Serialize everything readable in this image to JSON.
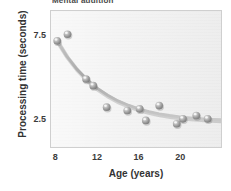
{
  "chart_data": {
    "type": "scatter",
    "title": "Mental addition",
    "xlabel": "Age (years)",
    "ylabel": "Processing time (seconds)",
    "xlim": [
      7.5,
      24.0
    ],
    "ylim": [
      0.8,
      9.0
    ],
    "xticks": [
      8,
      12,
      16,
      20
    ],
    "xticklabels": [
      "8",
      "12",
      "16",
      "20"
    ],
    "yticks": [
      2.5,
      7.5
    ],
    "yticklabels": [
      "2.5",
      "7.5"
    ],
    "grid": false,
    "legend": false,
    "x": [
      8.1,
      9.1,
      10.9,
      11.6,
      12.9,
      14.9,
      16.1,
      16.7,
      18.0,
      19.7,
      20.3,
      21.6,
      22.7
    ],
    "y": [
      7.2,
      7.6,
      4.9,
      4.5,
      3.2,
      3.0,
      3.1,
      2.4,
      3.3,
      2.2,
      2.5,
      2.7,
      2.5
    ],
    "points": [
      {
        "age": 8.1,
        "seconds": 7.2
      },
      {
        "age": 9.1,
        "seconds": 7.6
      },
      {
        "age": 10.9,
        "seconds": 4.9
      },
      {
        "age": 11.6,
        "seconds": 4.5
      },
      {
        "age": 12.9,
        "seconds": 3.2
      },
      {
        "age": 14.9,
        "seconds": 3.0
      },
      {
        "age": 16.1,
        "seconds": 3.1
      },
      {
        "age": 16.7,
        "seconds": 2.4
      },
      {
        "age": 18.0,
        "seconds": 3.3
      },
      {
        "age": 19.7,
        "seconds": 2.2
      },
      {
        "age": 20.3,
        "seconds": 2.5
      },
      {
        "age": 21.6,
        "seconds": 2.7
      },
      {
        "age": 22.7,
        "seconds": 2.5
      }
    ],
    "fit_curve": {
      "name": "exponential decay fit",
      "asymptote": 2.35,
      "x": [
        8.0,
        9.0,
        10.0,
        11.0,
        12.0,
        13.0,
        14.0,
        15.0,
        16.0,
        17.0,
        18.0,
        19.0,
        20.0,
        21.0,
        22.0,
        23.0,
        24.0
      ],
      "y": [
        7.3,
        6.3,
        5.5,
        4.85,
        4.33,
        3.92,
        3.58,
        3.32,
        3.1,
        2.93,
        2.8,
        2.7,
        2.62,
        2.56,
        2.51,
        2.47,
        2.44
      ]
    },
    "colors": {
      "marker": "#9a9a9a",
      "marker_highlight": "#d8d8d8",
      "curve": "#b0b0b0",
      "plot_background": "#f2f2f2",
      "plot_border": "#cfcfcf",
      "text": "#333333"
    }
  }
}
